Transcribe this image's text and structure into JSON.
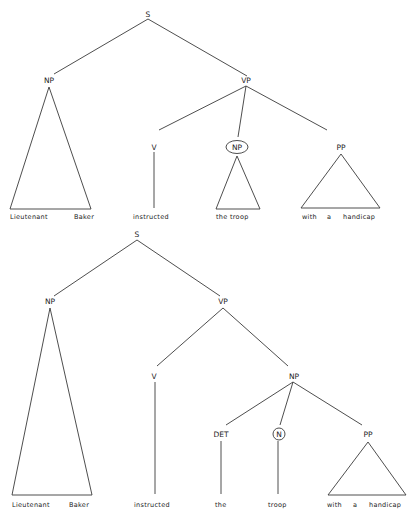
{
  "diagram": {
    "type": "syntax-trees",
    "tree1": {
      "root": "S",
      "np_label": "NP",
      "vp_label": "VP",
      "v_label": "V",
      "obj_np_label": "NP",
      "obj_np_circled": true,
      "pp_label": "PP",
      "words": {
        "subject_1": "Lieutenant",
        "subject_2": "Baker",
        "verb": "instructed",
        "object": "the troop",
        "pp_1": "with",
        "pp_2": "a",
        "pp_3": "handicap"
      }
    },
    "tree2": {
      "root": "S",
      "np_label": "NP",
      "vp_label": "VP",
      "v_label": "V",
      "obj_np_label": "NP",
      "det_label": "DET",
      "n_label": "N",
      "n_circled": true,
      "pp_label": "PP",
      "words": {
        "subject_1": "Lieutenant",
        "subject_2": "Baker",
        "verb": "instructed",
        "det": "the",
        "noun": "troop",
        "pp_1": "with",
        "pp_2": "a",
        "pp_3": "handicap"
      }
    }
  }
}
